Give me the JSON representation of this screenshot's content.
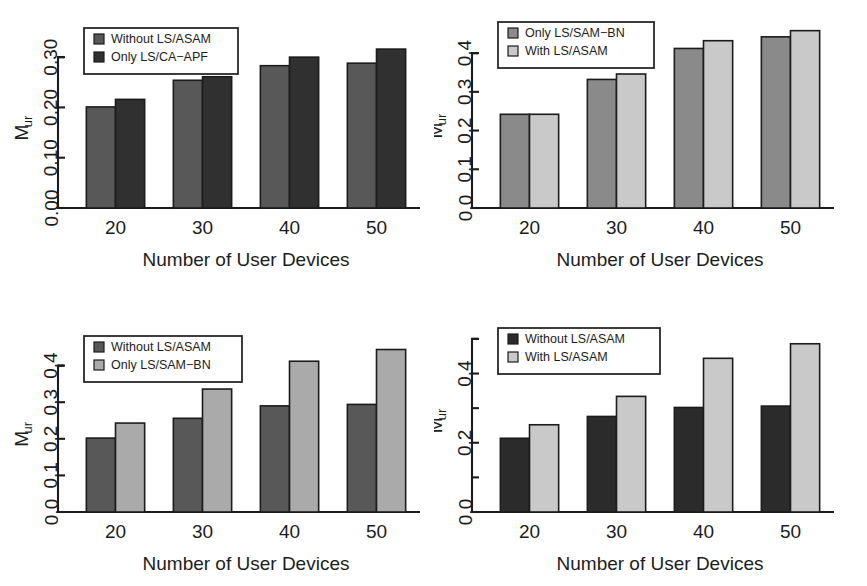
{
  "figure": {
    "background": "#ffffff",
    "axis_color": "#1c1c1c",
    "xlabel": "Number of User Devices",
    "ylabel_main": "M",
    "ylabel_sub": "ur",
    "categories": [
      "20",
      "30",
      "40",
      "50"
    ]
  },
  "chart_data": [
    {
      "id": "panel-top-left",
      "type": "bar",
      "title": "",
      "xlabel": "Number of User Devices",
      "ylabel": "M_ur",
      "categories": [
        "20",
        "30",
        "40",
        "50"
      ],
      "yticks": [
        "0.00",
        "0.10",
        "0.20",
        "0.30"
      ],
      "ytick_values": [
        0.0,
        0.1,
        0.2,
        0.3
      ],
      "ylim": [
        0,
        0.35
      ],
      "grid": false,
      "legend_position": "top-left",
      "series": [
        {
          "name": "Without LS/ASAM",
          "color": "#585858",
          "values": [
            0.201,
            0.254,
            0.283,
            0.288
          ]
        },
        {
          "name": "Only LS/CA−APF",
          "color": "#303030",
          "values": [
            0.216,
            0.261,
            0.3,
            0.316
          ]
        }
      ]
    },
    {
      "id": "panel-top-right",
      "type": "bar",
      "title": "",
      "xlabel": "Number of User Devices",
      "ylabel": "M_ur",
      "categories": [
        "20",
        "30",
        "40",
        "50"
      ],
      "yticks": [
        "0.0",
        "0.1",
        "0.2",
        "0.3",
        "0.4"
      ],
      "ytick_values": [
        0.0,
        0.1,
        0.2,
        0.3,
        0.4
      ],
      "ylim": [
        0,
        0.47
      ],
      "grid": false,
      "legend_position": "top-left",
      "series": [
        {
          "name": "Only LS/SAM−BN",
          "color": "#8a8a8a",
          "values": [
            0.242,
            0.332,
            0.412,
            0.442
          ]
        },
        {
          "name": "With LS/ASAM",
          "color": "#c9c9c9",
          "values": [
            0.242,
            0.346,
            0.432,
            0.458
          ]
        }
      ]
    },
    {
      "id": "panel-bottom-left",
      "type": "bar",
      "title": "",
      "xlabel": "Number of User Devices",
      "ylabel": "M_ur",
      "categories": [
        "20",
        "30",
        "40",
        "50"
      ],
      "yticks": [
        "0.0",
        "0.1",
        "0.2",
        "0.3",
        "0.4"
      ],
      "ytick_values": [
        0.0,
        0.1,
        0.2,
        0.3,
        0.4
      ],
      "ylim": [
        0,
        0.47
      ],
      "grid": false,
      "legend_position": "top-left",
      "series": [
        {
          "name": "Without LS/ASAM",
          "color": "#585858",
          "values": [
            0.202,
            0.256,
            0.29,
            0.294
          ]
        },
        {
          "name": "Only LS/SAM−BN",
          "color": "#aaaaaa",
          "values": [
            0.243,
            0.336,
            0.412,
            0.444
          ]
        }
      ]
    },
    {
      "id": "panel-bottom-right",
      "type": "bar",
      "title": "",
      "xlabel": "Number of User Devices",
      "ylabel": "M_ur",
      "categories": [
        "20",
        "30",
        "40",
        "50"
      ],
      "yticks": [
        "0.0",
        "",
        "0.2",
        "",
        "0.4",
        ""
      ],
      "ytick_values": [
        0.0,
        0.1,
        0.2,
        0.3,
        0.4,
        0.5
      ],
      "ylim": [
        0,
        0.52
      ],
      "grid": false,
      "legend_position": "top-left",
      "series": [
        {
          "name": "Without LS/ASAM",
          "color": "#2b2b2b",
          "values": [
            0.213,
            0.276,
            0.302,
            0.306
          ]
        },
        {
          "name": "With LS/ASAM",
          "color": "#c9c9c9",
          "values": [
            0.252,
            0.334,
            0.444,
            0.486
          ]
        }
      ]
    }
  ]
}
